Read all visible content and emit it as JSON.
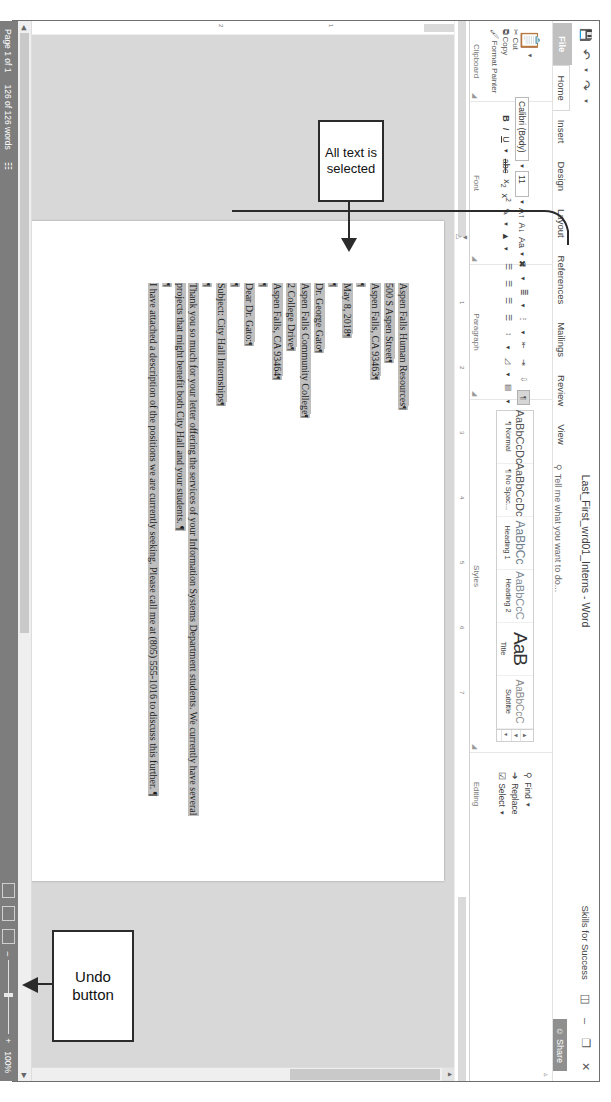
{
  "window": {
    "doc_title": "Last_First_wrd01_Interns - Word",
    "user_name": "Skills for Success",
    "share_label": "Share",
    "share_icon": "person-share-icon",
    "ribbon_display_icon": "ribbon-display-options-icon",
    "minimize_icon": "minimize-icon",
    "restore_icon": "restore-icon",
    "close_icon": "close-icon"
  },
  "quick_access": {
    "save_icon": "save-icon",
    "undo_icon": "undo-icon",
    "undo_dropdown_icon": "chevron-down-icon",
    "redo_icon": "redo-icon",
    "customize_icon": "customize-quick-access-icon"
  },
  "tabs": [
    {
      "label": "File",
      "active": false,
      "file": true
    },
    {
      "label": "Home",
      "active": true,
      "file": false
    },
    {
      "label": "Insert",
      "active": false,
      "file": false
    },
    {
      "label": "Design",
      "active": false,
      "file": false
    },
    {
      "label": "Layout",
      "active": false,
      "file": false
    },
    {
      "label": "References",
      "active": false,
      "file": false
    },
    {
      "label": "Mailings",
      "active": false,
      "file": false
    },
    {
      "label": "Review",
      "active": false,
      "file": false
    },
    {
      "label": "View",
      "active": false,
      "file": false
    }
  ],
  "tell_me": {
    "text": "Tell me what you want to do...",
    "icon": "lightbulb-icon"
  },
  "ribbon": {
    "clipboard": {
      "group_name": "Clipboard",
      "paste_label": "Paste",
      "cut_label": "Cut",
      "copy_label": "Copy",
      "format_painter_label": "Format Painter",
      "paste_icon": "clipboard-paste-icon",
      "cut_icon": "scissors-icon",
      "copy_icon": "copy-icon",
      "format_painter_icon": "paintbrush-icon",
      "dialog_launcher_icon": "dialog-launcher-icon"
    },
    "font": {
      "group_name": "Font",
      "font_name": "Calibri (Body)",
      "font_size": "11",
      "bold": "B",
      "italic": "I",
      "underline": "U",
      "strikethrough": "abc",
      "subscript": "x",
      "superscript": "x",
      "grow_font_icon": "grow-font-icon",
      "shrink_font_icon": "shrink-font-icon",
      "change_case_label": "Aa",
      "clear_formatting_icon": "clear-formatting-icon",
      "text_highlight_icon": "text-highlight-color-icon",
      "font_color_icon": "font-color-icon",
      "dialog_launcher_icon": "dialog-launcher-icon"
    },
    "paragraph": {
      "group_name": "Paragraph",
      "bullets_icon": "bullets-icon",
      "numbering_icon": "numbering-icon",
      "multilevel_icon": "multilevel-list-icon",
      "decrease_indent_icon": "decrease-indent-icon",
      "increase_indent_icon": "increase-indent-icon",
      "sort_icon": "sort-icon",
      "show_marks_icon": "show-formatting-marks-icon",
      "align_left_icon": "align-left-icon",
      "align_center_icon": "align-center-icon",
      "align_right_icon": "align-right-icon",
      "justify_icon": "justify-icon",
      "line_spacing_icon": "line-spacing-icon",
      "shading_icon": "shading-icon",
      "borders_icon": "borders-icon",
      "dialog_launcher_icon": "dialog-launcher-icon"
    },
    "styles": {
      "group_name": "Styles",
      "items": [
        {
          "preview": "AaBbCcDc",
          "name": "¶ Normal"
        },
        {
          "preview": "AaBbCcDc",
          "name": "¶ No Spac..."
        },
        {
          "preview": "AaBbCc",
          "name": "Heading 1"
        },
        {
          "preview": "AaBbCcC",
          "name": "Heading 2"
        },
        {
          "preview": "AaB",
          "name": "Title"
        },
        {
          "preview": "AaBbCcC",
          "name": "Subtitle"
        }
      ],
      "scroll_up_icon": "scroll-up-icon",
      "scroll_down_icon": "scroll-down-icon",
      "more_icon": "more-styles-icon",
      "dialog_launcher_icon": "dialog-launcher-icon"
    },
    "editing": {
      "group_name": "Editing",
      "find_label": "Find",
      "replace_label": "Replace",
      "select_label": "Select",
      "find_icon": "magnifier-icon",
      "replace_icon": "replace-icon",
      "select_icon": "select-icon",
      "find_dropdown_icon": "chevron-down-icon",
      "select_dropdown_icon": "chevron-down-icon"
    }
  },
  "ruler": {
    "horizontal_ticks": [
      "1",
      "2",
      "3",
      "4",
      "5",
      "6",
      "7"
    ],
    "vertical_ticks": [
      "1",
      "2"
    ]
  },
  "document": {
    "selected": true,
    "pilcrow": "¶",
    "lines": [
      {
        "text": "Aspen Falls Human Resources",
        "mark": "¶",
        "highlight": true
      },
      {
        "text": "500 S Aspen Street",
        "mark": "¶",
        "highlight": true
      },
      {
        "text": "Aspen Falls, CA 93463",
        "mark": "¶",
        "highlight": true
      },
      {
        "text": "",
        "mark": "¶",
        "highlight": true
      },
      {
        "text": "May 8, 2018",
        "mark": "¶",
        "highlight": true
      },
      {
        "text": "",
        "mark": "¶",
        "highlight": true
      },
      {
        "text": "Dr. George Gato",
        "mark": "¶",
        "highlight": true
      },
      {
        "text": "Aspen Falls Community College",
        "mark": "¶",
        "highlight": true
      },
      {
        "text": "2 College Drive",
        "mark": "¶",
        "highlight": true
      },
      {
        "text": "Aspen Falls, CA 93464",
        "mark": "¶",
        "highlight": true
      },
      {
        "text": "",
        "mark": "¶",
        "highlight": true
      },
      {
        "text": "Dear Dr. Gato:",
        "mark": "¶",
        "highlight": true
      },
      {
        "text": "",
        "mark": "¶",
        "highlight": true
      },
      {
        "text": "Subject: City Hall Internships",
        "mark": "¶",
        "highlight": true
      },
      {
        "text": "",
        "mark": "¶",
        "highlight": true
      },
      {
        "text": "Thank you so much for your letter offering the services of your Information Systems Department students.  We currently have several projects that might benefit both City Hall and your students. ¶",
        "mark": "",
        "highlight": true
      },
      {
        "text": "",
        "mark": "¶",
        "highlight": true
      },
      {
        "text": "I have attached a description of the positions we are currently seeking.  Please call me at (805) 555-1016 to discuss this further. ¶",
        "mark": "",
        "highlight": true
      }
    ]
  },
  "status_bar": {
    "page_label": "Page 1 of 1",
    "word_count": "126 of 126 words",
    "proofing_icon": "proofing-errors-icon",
    "read_mode_icon": "read-mode-icon",
    "print_layout_icon": "print-layout-icon",
    "web_layout_icon": "web-layout-icon",
    "zoom_out_icon": "zoom-out-icon",
    "zoom_in_icon": "zoom-in-icon",
    "zoom_level": "100%"
  },
  "callouts": [
    {
      "id": "all-text",
      "text": "All text is selected"
    },
    {
      "id": "undo",
      "text": "Undo button"
    }
  ],
  "colors": {
    "status_bar": "#7d7d7d",
    "file_tab": "#c0c0c0",
    "share_button": "#8f8f8f",
    "selection_highlight": "#bfbfbf",
    "canvas_background": "#d8d8d8"
  }
}
